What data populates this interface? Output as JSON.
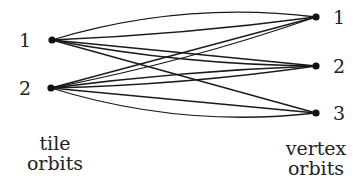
{
  "diagram": {
    "type": "bipartite-multigraph",
    "left_group": {
      "label_line1": "tile",
      "label_line2": "orbits",
      "nodes": [
        {
          "id": "L1",
          "label": "1",
          "x": 52,
          "y": 40
        },
        {
          "id": "L2",
          "label": "2",
          "x": 51,
          "y": 88
        }
      ]
    },
    "right_group": {
      "label_line1": "vertex",
      "label_line2": "orbits",
      "nodes": [
        {
          "id": "R1",
          "label": "1",
          "x": 316,
          "y": 17
        },
        {
          "id": "R2",
          "label": "2",
          "x": 316,
          "y": 66
        },
        {
          "id": "R3",
          "label": "3",
          "x": 316,
          "y": 113
        }
      ]
    },
    "edges": [
      {
        "from": "L1",
        "to": "R1",
        "curve": -14
      },
      {
        "from": "L1",
        "to": "R1",
        "curve": 3
      },
      {
        "from": "L1",
        "to": "R2",
        "curve": 0
      },
      {
        "from": "L1",
        "to": "R2",
        "curve": 6
      },
      {
        "from": "L1",
        "to": "R3",
        "curve": 0
      },
      {
        "from": "L2",
        "to": "R1",
        "curve": 0
      },
      {
        "from": "L2",
        "to": "R1",
        "curve": 5
      },
      {
        "from": "L2",
        "to": "R2",
        "curve": -3
      },
      {
        "from": "L2",
        "to": "R2",
        "curve": 4
      },
      {
        "from": "L2",
        "to": "R3",
        "curve": 0
      },
      {
        "from": "L2",
        "to": "R3",
        "curve": 14
      }
    ],
    "colors": {
      "edge": "#1a1a1a",
      "node": "#111111",
      "text": "#222222",
      "background": "#ffffff"
    }
  }
}
